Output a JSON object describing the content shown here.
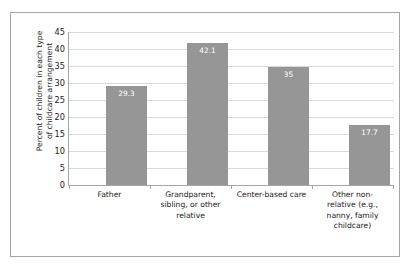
{
  "chart_data": {
    "type": "bar",
    "title": "",
    "xlabel": "",
    "ylabel": "Percent of children in each type of childcare arrangement",
    "ylabel_lines": [
      "Percent of children in each type",
      "of childcare arrangement"
    ],
    "categories": [
      "Father",
      "Grandparent, sibling, or other relative",
      "Center-based care",
      "Other non-relative (e.g., nanny, family childcare)"
    ],
    "category_lines": [
      [
        "Father"
      ],
      [
        "Grandparent,",
        "sibling, or other",
        "relative"
      ],
      [
        "Center-based care"
      ],
      [
        "Other non-",
        "relative (e.g.,",
        "nanny, family",
        "childcare)"
      ]
    ],
    "values": [
      29.3,
      42.1,
      35,
      17.7
    ],
    "value_labels": [
      "29.3",
      "42.1",
      "35",
      "17.7"
    ],
    "ylim": [
      0,
      45
    ],
    "ytick_labels": [
      "45",
      "40",
      "35",
      "30",
      "25",
      "20",
      "15",
      "10",
      "5",
      "0"
    ],
    "ytick_values": [
      45,
      40,
      35,
      30,
      25,
      20,
      15,
      10,
      5,
      0
    ],
    "grid": true,
    "legend": "none",
    "colors": {
      "bar": "#969696",
      "gridline": "#d9d9d9",
      "axis": "#a6a6a6",
      "value_label": "#ffffff",
      "text": "#1a1a1a",
      "background": "#ffffff",
      "frame_border": "#a6a6a6"
    }
  }
}
